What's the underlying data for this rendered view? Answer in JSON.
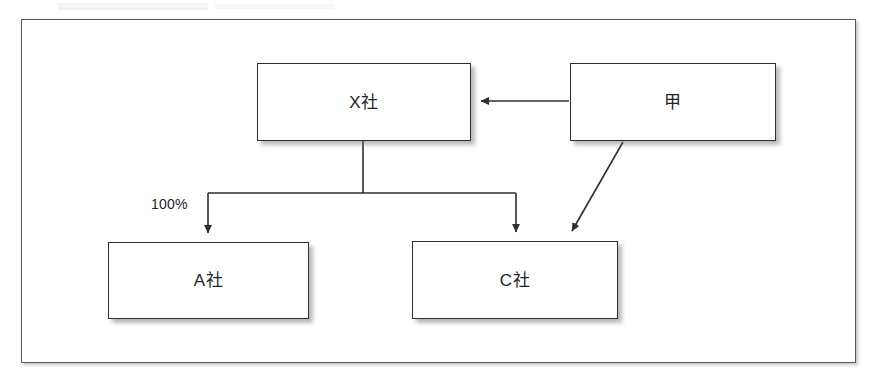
{
  "diagram": {
    "title": "",
    "frame": {
      "name": "diagram-frame"
    },
    "nodes": [
      {
        "id": "x",
        "label": "X社",
        "name": "node-x-company"
      },
      {
        "id": "kou",
        "label": "甲",
        "name": "node-kou-person"
      },
      {
        "id": "a",
        "label": "A社",
        "name": "node-a-company"
      },
      {
        "id": "c",
        "label": "C社",
        "name": "node-c-company"
      }
    ],
    "edges": [
      {
        "id": "kou-to-x",
        "from": "甲",
        "to": "X社",
        "label": "",
        "style": "solid-arrow",
        "shape": "horizontal"
      },
      {
        "id": "x-to-a",
        "from": "X社",
        "to": "A社",
        "label": "100%",
        "style": "solid-arrow",
        "shape": "orthogonal"
      },
      {
        "id": "x-to-c",
        "from": "X社",
        "to": "C社",
        "label": "",
        "style": "solid-arrow",
        "shape": "orthogonal"
      },
      {
        "id": "kou-to-c",
        "from": "甲",
        "to": "C社",
        "label": "",
        "style": "solid-arrow",
        "shape": "diagonal"
      }
    ],
    "edge_labels": [
      {
        "id": "pct-100",
        "text": "100%"
      }
    ],
    "colors": {
      "node_border": "#2b2f33",
      "node_fill": "#ffffff",
      "frame_border": "#555a5e",
      "line": "#2b2f33",
      "text": "#202427",
      "background": "#ffffff"
    }
  }
}
